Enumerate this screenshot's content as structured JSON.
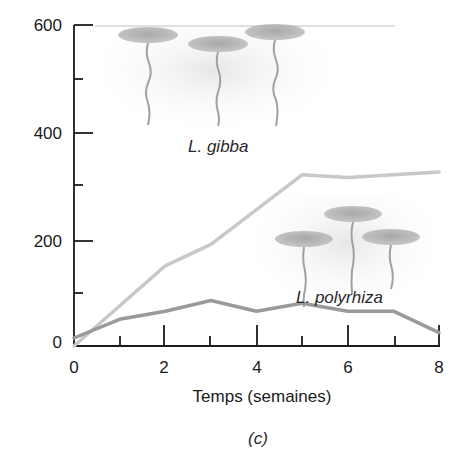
{
  "chart_data": {
    "type": "line",
    "title": "",
    "caption": "(c)",
    "xlabel": "Temps (semaines)",
    "ylabel": "",
    "xlim": [
      0,
      8
    ],
    "ylim": [
      0,
      600
    ],
    "x_ticks_major": [
      0,
      2,
      4,
      6,
      8
    ],
    "x_ticks_minor": [
      1,
      3,
      5,
      7
    ],
    "y_ticks_major": [
      0,
      200,
      400,
      600
    ],
    "y_ticks_minor": [
      100,
      300,
      500
    ],
    "x_tick_labels": [
      "0",
      "2",
      "4",
      "6",
      "8"
    ],
    "y_tick_labels": [
      "0",
      "200",
      "400",
      "600"
    ],
    "grid": false,
    "legend": "none (inline labels)",
    "series": [
      {
        "name": "L. gibba",
        "color": "#c8c8c8",
        "x": [
          0,
          2,
          3,
          5,
          6,
          8
        ],
        "values": [
          0,
          150,
          190,
          320,
          315,
          325
        ]
      },
      {
        "name": "L. polyrhiza",
        "color": "#9a9a9a",
        "x": [
          0,
          1,
          2,
          3,
          4,
          5,
          6,
          7,
          8
        ],
        "values": [
          15,
          50,
          65,
          85,
          65,
          80,
          65,
          65,
          25
        ]
      }
    ],
    "annotations": [
      {
        "text": "L. gibba",
        "x": 4.0,
        "y": 375
      },
      {
        "text": "L. polyrhiza",
        "x": 6.2,
        "y": 80
      }
    ]
  }
}
